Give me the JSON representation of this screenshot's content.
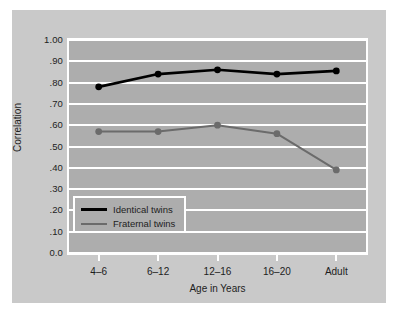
{
  "chart_data": {
    "type": "line",
    "title": "",
    "xlabel": "Age in Years",
    "ylabel": "Correlation",
    "categories": [
      "4–6",
      "6–12",
      "12–16",
      "16–20",
      "Adult"
    ],
    "ylim": [
      0.0,
      1.0
    ],
    "yticks": [
      0.0,
      0.1,
      0.2,
      0.3,
      0.4,
      0.5,
      0.6,
      0.7,
      0.8,
      0.9,
      1.0
    ],
    "ytick_labels": [
      "0.0",
      ".10",
      ".20",
      ".30",
      ".40",
      ".50",
      ".60",
      ".70",
      ".80",
      ".90",
      "1.00"
    ],
    "grid": true,
    "legend_position": "lower left",
    "series": [
      {
        "name": "Identical twins",
        "color": "#000000",
        "values": [
          0.78,
          0.84,
          0.86,
          0.84,
          0.855
        ]
      },
      {
        "name": "Fraternal twins",
        "color": "#6b6b6b",
        "values": [
          0.57,
          0.57,
          0.6,
          0.56,
          0.39
        ]
      }
    ]
  },
  "legend": {
    "items": [
      {
        "label": "Identical twins"
      },
      {
        "label": "Fraternal twins"
      }
    ]
  },
  "colors": {
    "figure_background": "#ffffff",
    "panel_background": "#c9c9c9",
    "plot_background": "#adadad",
    "gridline": "#ffffff",
    "identical_twins": "#000000",
    "fraternal_twins": "#6b6b6b",
    "text": "#1d1d1d"
  }
}
